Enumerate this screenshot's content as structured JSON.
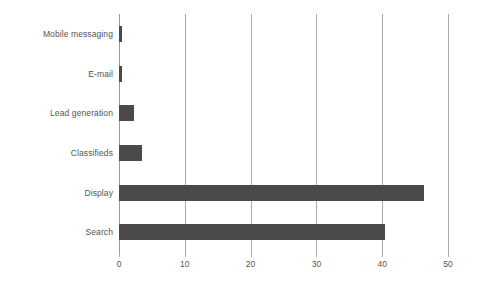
{
  "chart_data": {
    "type": "bar",
    "orientation": "horizontal",
    "title": "",
    "subtitle": "",
    "xlabel": "",
    "ylabel": "",
    "categories": [
      "Mobile messaging",
      "E-mail",
      "Lead generation",
      "Classifieds",
      "Display",
      "Search"
    ],
    "values": [
      0.4,
      0.4,
      2.3,
      3.5,
      46.4,
      40.4
    ],
    "xlim": [
      0,
      50
    ],
    "xticks": [
      0,
      10,
      20,
      30,
      40,
      50
    ],
    "xtick_labels": [
      "0",
      "10",
      "20",
      "30",
      "40",
      "50"
    ],
    "grid": true,
    "grid_axis": "x",
    "legend": false,
    "legend_position": "none",
    "bar_color": "#4a4a4a",
    "gridline_color": "#aaaaaa",
    "text_color": "#555555",
    "background_color": "#ffffff"
  }
}
